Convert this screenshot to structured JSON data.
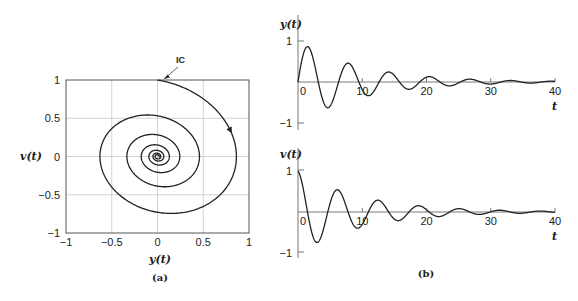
{
  "figure": {
    "panel_a": {
      "caption": "(a)",
      "xlabel": "y(t)",
      "ylabel": "v(t)",
      "x_ticks": [
        "-1",
        "-0.5",
        "0",
        "0.5",
        "1"
      ],
      "y_ticks": [
        "1",
        "0.5",
        "0",
        "-0.5",
        "-1"
      ],
      "annotation": "IC"
    },
    "panel_b": {
      "caption": "(b)",
      "top": {
        "ylabel": "y(t)",
        "xlabel": "t",
        "x_ticks": [
          "0",
          "10",
          "20",
          "30",
          "40"
        ],
        "y_ticks": [
          "1",
          "-1"
        ]
      },
      "bottom": {
        "ylabel": "v(t)",
        "xlabel": "t",
        "x_ticks": [
          "0",
          "10",
          "20",
          "30",
          "40"
        ],
        "y_ticks": [
          "1",
          "-1"
        ]
      }
    }
  },
  "chart_data": [
    {
      "type": "line",
      "title": "(a) Phase plane trajectory",
      "xlabel": "y(t)",
      "ylabel": "v(t)",
      "xlim": [
        -1,
        1
      ],
      "ylim": [
        -1,
        1
      ],
      "grid": true,
      "annotations": [
        {
          "text": "IC",
          "x": 0,
          "y": 1
        }
      ],
      "model": {
        "equation": "y'' + 2*zeta*y' + y = 0",
        "zeta": 0.1,
        "omega": 1.0,
        "y0": 0,
        "v0": 1,
        "t_end": 40
      },
      "series": [
        {
          "name": "trajectory",
          "description": "clockwise decaying spiral from (0,1) to origin"
        }
      ]
    },
    {
      "type": "line",
      "title": "(b) top: y(t)",
      "xlabel": "t",
      "ylabel": "y(t)",
      "xlim": [
        0,
        40
      ],
      "ylim": [
        -1,
        1
      ],
      "x": [
        0,
        1.3,
        4.5,
        7.6,
        10.7,
        13.9,
        17.0,
        20.2,
        23.3,
        26.5,
        29.6,
        32.8,
        40
      ],
      "series": [
        {
          "name": "y(t)",
          "values": [
            0,
            0.83,
            -0.63,
            0.48,
            -0.36,
            0.27,
            -0.2,
            0.15,
            -0.12,
            0.09,
            -0.07,
            0.05,
            0.0
          ]
        }
      ]
    },
    {
      "type": "line",
      "title": "(b) bottom: v(t)",
      "xlabel": "t",
      "ylabel": "v(t)",
      "xlim": [
        0,
        40
      ],
      "ylim": [
        -1,
        1
      ],
      "x": [
        0,
        2.9,
        6.0,
        9.2,
        12.3,
        15.5,
        18.6,
        21.8,
        24.9,
        28.1,
        31.2,
        40
      ],
      "series": [
        {
          "name": "v(t)",
          "values": [
            1.0,
            -0.72,
            0.55,
            -0.41,
            0.31,
            -0.23,
            0.17,
            -0.13,
            0.1,
            -0.07,
            0.05,
            0.0
          ]
        }
      ]
    }
  ]
}
